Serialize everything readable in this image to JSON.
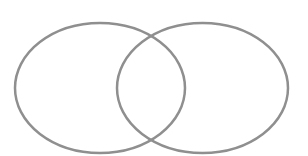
{
  "diagram": {
    "type": "venn",
    "sets": [
      {
        "id": "left",
        "label": "",
        "cx": 100,
        "cy": 88,
        "rx": 85,
        "ry": 65
      },
      {
        "id": "right",
        "label": "",
        "cx": 202.5,
        "cy": 88,
        "rx": 85.5,
        "ry": 65
      }
    ],
    "stroke_color": "#8f8f8f",
    "stroke_width": 2.5,
    "background": "#ffffff"
  }
}
